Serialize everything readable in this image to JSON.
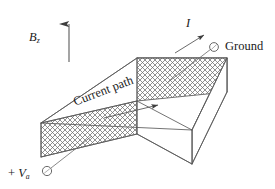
{
  "figure": {
    "background_color": "#ffffff",
    "line_color": "#4a4a4a",
    "hatch_color": "#808080",
    "text_color": "#1a1a1a"
  },
  "labels": {
    "magnetic_field": {
      "symbol": "B",
      "subscript": "z",
      "text": "Bz"
    },
    "current": {
      "symbol": "I",
      "text": "I"
    },
    "ground": {
      "text": "Ground"
    },
    "applied_voltage": {
      "prefix": "+ ",
      "symbol": "V",
      "subscript": "a",
      "text": "+ Va"
    },
    "current_path": {
      "text": "Current path"
    }
  },
  "annotations": {
    "field_arrow_direction": "up",
    "current_arrow_direction": "up-right",
    "current_path_arrow_direction": "right",
    "ground_terminal": "open-circle",
    "voltage_terminal": "open-circle"
  },
  "geometry": {
    "slab_description": "rectangular slab in oblique projection with cross-hatched end faces",
    "hatched_faces": [
      "front-left end face",
      "back-right end face"
    ]
  }
}
